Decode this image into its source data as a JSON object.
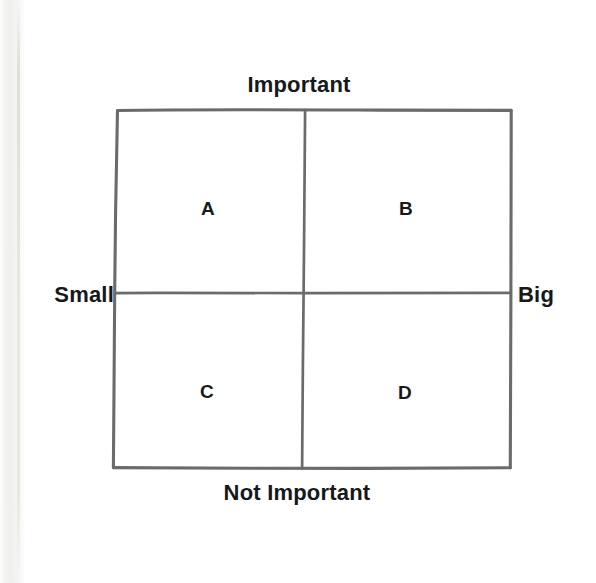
{
  "diagram": {
    "type": "2x2-matrix",
    "axes": {
      "top_label": "Important",
      "bottom_label": "Not Important",
      "left_label": "Small",
      "right_label": "Big"
    },
    "quadrants": [
      {
        "id": "a",
        "label": "A",
        "position": "top-left",
        "x_axis": "Small",
        "y_axis": "Important"
      },
      {
        "id": "b",
        "label": "B",
        "position": "top-right",
        "x_axis": "Big",
        "y_axis": "Important"
      },
      {
        "id": "c",
        "label": "C",
        "position": "bottom-left",
        "x_axis": "Small",
        "y_axis": "Not Important"
      },
      {
        "id": "d",
        "label": "D",
        "position": "bottom-right",
        "x_axis": "Big",
        "y_axis": "Not Important"
      }
    ],
    "colors": {
      "background": "#ffffff",
      "line": "#6b6b6b",
      "text": "#16181a"
    }
  }
}
